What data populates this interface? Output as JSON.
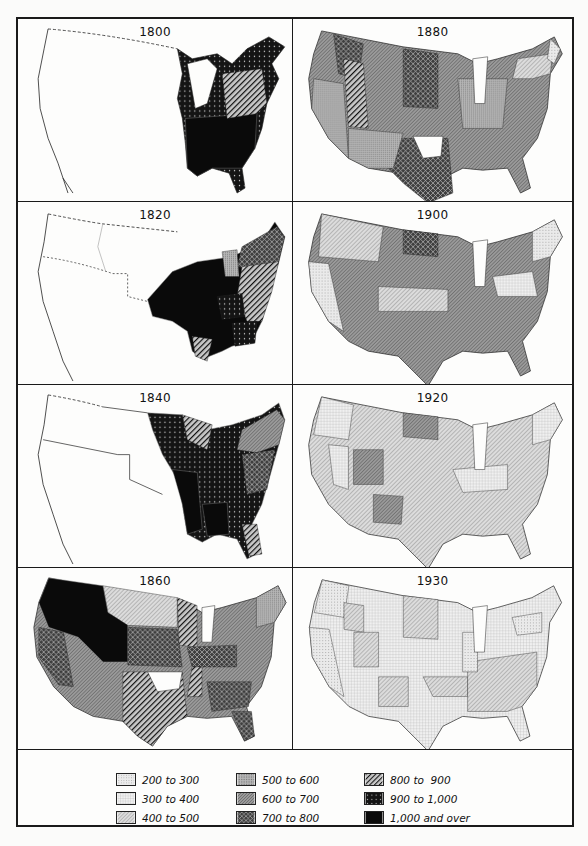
{
  "figure": {
    "panels": [
      {
        "year": "1800",
        "position": "row1-left"
      },
      {
        "year": "1880",
        "position": "row1-right"
      },
      {
        "year": "1820",
        "position": "row2-left"
      },
      {
        "year": "1900",
        "position": "row2-right"
      },
      {
        "year": "1840",
        "position": "row3-left"
      },
      {
        "year": "1920",
        "position": "row3-right"
      },
      {
        "year": "1860",
        "position": "row4-left"
      },
      {
        "year": "1930",
        "position": "row4-right"
      }
    ],
    "legend": {
      "items": [
        {
          "label": "200 to 300",
          "pattern": "fine-dots-light"
        },
        {
          "label": "300 to 400",
          "pattern": "grid-light"
        },
        {
          "label": "400 to 500",
          "pattern": "diagonal-light"
        },
        {
          "label": "500 to 600",
          "pattern": "dense-grid-medium"
        },
        {
          "label": "600 to 700",
          "pattern": "dense-diagonal-medium"
        },
        {
          "label": "700 to 800",
          "pattern": "crosshatch-dark"
        },
        {
          "label": "800 to  900",
          "pattern": "heavy-diagonal"
        },
        {
          "label": "900 to 1,000",
          "pattern": "dots-on-black"
        },
        {
          "label": "1,000 and over",
          "pattern": "solid-black"
        }
      ]
    }
  },
  "colors": {
    "border": "#1a1a1a",
    "paper": "#fdfdfc",
    "c200": "#e4e4e4",
    "c300": "#ececec",
    "c400": "#cfcfcf",
    "c500": "#a9a9a9",
    "c600": "#8e8e8e",
    "c700": "#5a5a5a",
    "c800": "#3a3a3a",
    "c900": "#1e1e1e",
    "c1000": "#0a0a0a"
  }
}
